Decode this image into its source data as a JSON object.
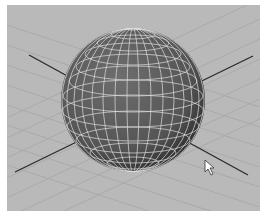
{
  "viewport": {
    "name": "3D perspective viewport",
    "object": "polygon sphere",
    "background": "#b9b9b9",
    "grid_color": "#a4a4a4",
    "axis_color": "#2a2a2a",
    "sphere_color": "#5a5a5a",
    "wire_color": "#e6e6e6"
  },
  "cursor": {
    "type": "arrow-pointer",
    "x": 205,
    "y": 160
  }
}
